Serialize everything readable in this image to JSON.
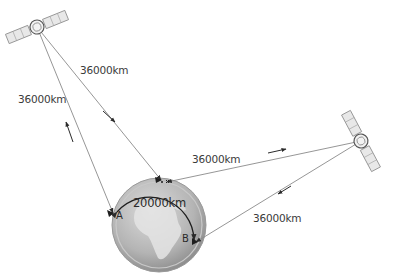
{
  "diagram": {
    "labels": {
      "sat1_to_earth_right": "36000km",
      "sat1_to_earth_left": "36000km",
      "sat2_to_earth_top": "36000km",
      "sat2_to_earth_bottom": "36000km",
      "surface_distance": "20000km",
      "point_a": "A",
      "point_b": "B"
    },
    "nodes": [
      {
        "id": "satellite-1",
        "type": "satellite",
        "x": 37,
        "y": 27
      },
      {
        "id": "satellite-2",
        "type": "satellite",
        "x": 361,
        "y": 141
      },
      {
        "id": "earth",
        "type": "globe",
        "x": 159,
        "y": 225,
        "r": 47
      },
      {
        "id": "point-a",
        "type": "ground-station",
        "x": 113,
        "y": 213
      },
      {
        "id": "point-b",
        "type": "ground-station",
        "x": 195,
        "y": 242
      }
    ],
    "edges": [
      {
        "from": "point-a",
        "to": "satellite-1",
        "label": "36000km",
        "direction": "up"
      },
      {
        "from": "satellite-1",
        "to": "earth-top",
        "label": "36000km",
        "direction": "down"
      },
      {
        "from": "earth-top",
        "to": "satellite-2",
        "label": "36000km",
        "direction": "right"
      },
      {
        "from": "satellite-2",
        "to": "point-b",
        "label": "36000km",
        "direction": "down-left"
      }
    ],
    "colors": {
      "line": "#8a8a8a",
      "arrow": "#2a2a2a",
      "globe_light": "#d8d8d8",
      "globe_dark": "#8c8c8c",
      "continent": "#e6e6e6"
    }
  }
}
